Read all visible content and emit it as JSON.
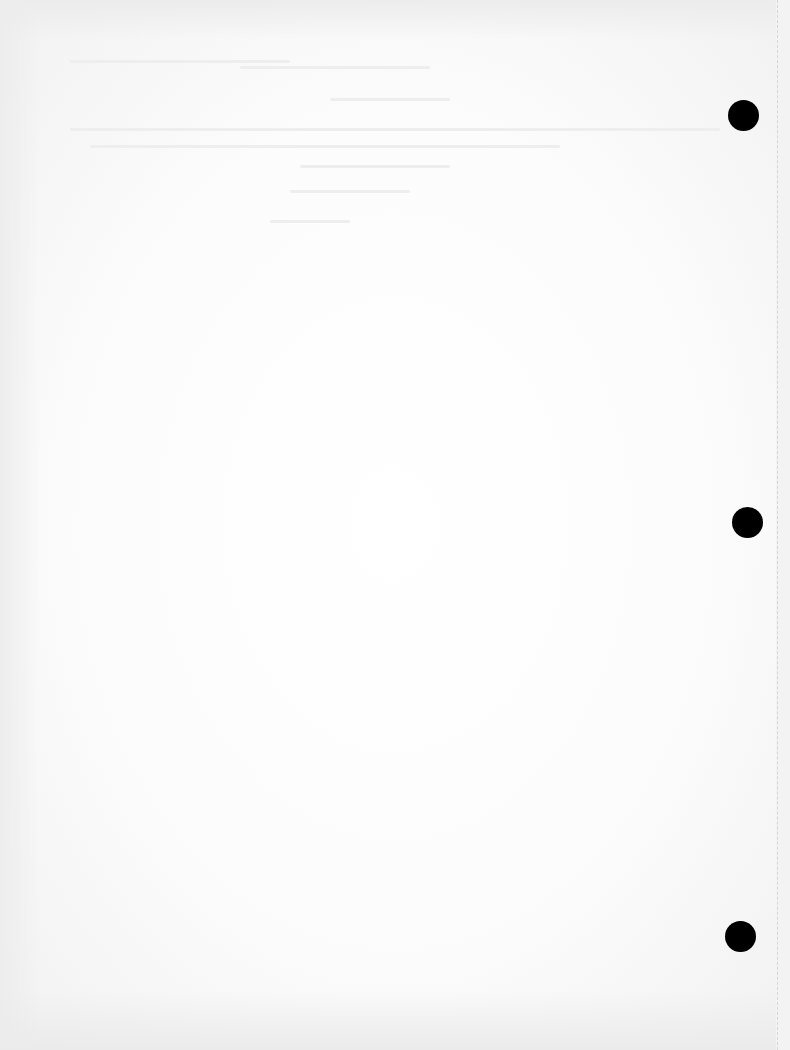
{
  "document": {
    "type": "blank scanned page",
    "background_color": "#fcfcfc",
    "punch_holes": [
      {
        "cx": 743,
        "cy": 115
      },
      {
        "cx": 747,
        "cy": 522
      },
      {
        "cx": 740,
        "cy": 936
      }
    ],
    "hole_color": "#000000"
  }
}
